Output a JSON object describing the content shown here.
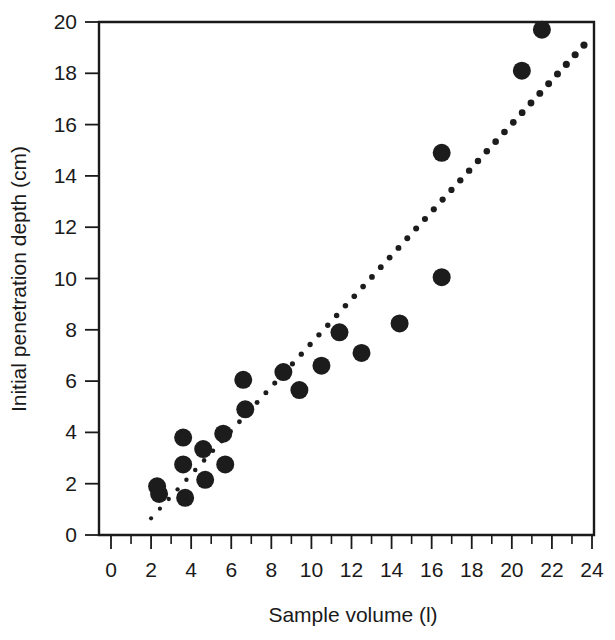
{
  "chart_data": {
    "type": "scatter",
    "title": "",
    "xlabel": "Sample volume (l)",
    "ylabel": "Initial penetration depth (cm)",
    "xlim": [
      0,
      24
    ],
    "ylim": [
      0,
      20
    ],
    "grid": false,
    "legend": null,
    "x_ticks": [
      0,
      2,
      4,
      6,
      8,
      10,
      12,
      14,
      16,
      18,
      20,
      22,
      24
    ],
    "x_tick_labels": [
      "0",
      "2",
      "4",
      "6",
      "8",
      "10",
      "12",
      "14",
      "16",
      "18",
      "20",
      "22",
      "24"
    ],
    "x_minor_ticks": [
      1,
      3,
      5,
      7,
      9,
      11,
      13,
      15,
      17,
      19,
      21,
      23
    ],
    "y_ticks": [
      0,
      2,
      4,
      6,
      8,
      10,
      12,
      14,
      16,
      18,
      20
    ],
    "y_tick_labels": [
      "0",
      "2",
      "4",
      "6",
      "8",
      "10",
      "12",
      "14",
      "16",
      "18",
      "20"
    ],
    "marker": {
      "shape": "circle",
      "color": "#1c1c1c",
      "radius_px": 9
    },
    "series": [
      {
        "name": "observations",
        "points": [
          [
            2.3,
            1.9
          ],
          [
            2.4,
            1.6
          ],
          [
            3.6,
            3.8
          ],
          [
            3.6,
            2.75
          ],
          [
            3.7,
            1.45
          ],
          [
            4.6,
            3.35
          ],
          [
            4.7,
            2.15
          ],
          [
            5.6,
            3.95
          ],
          [
            5.7,
            2.75
          ],
          [
            6.6,
            6.05
          ],
          [
            6.7,
            4.9
          ],
          [
            8.6,
            6.35
          ],
          [
            9.4,
            5.65
          ],
          [
            10.5,
            6.6
          ],
          [
            11.4,
            7.9
          ],
          [
            12.5,
            7.1
          ],
          [
            14.4,
            8.25
          ],
          [
            16.5,
            14.9
          ],
          [
            16.5,
            10.05
          ],
          [
            20.5,
            18.1
          ],
          [
            21.5,
            19.7
          ]
        ]
      }
    ],
    "trend_line": {
      "name": "fitted regression line",
      "style": "dotted",
      "color": "#1c1c1c",
      "x_start": 2.0,
      "y_start": 0.65,
      "x_end": 23.6,
      "y_end": 19.1
    }
  },
  "axes": {
    "x_title": "Sample volume (l)",
    "y_title": "Initial penetration depth (cm)"
  }
}
